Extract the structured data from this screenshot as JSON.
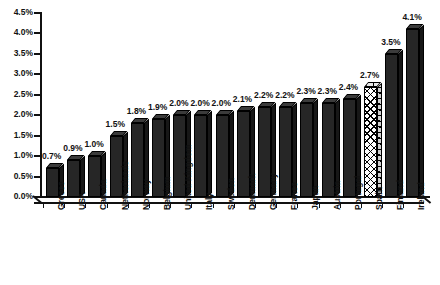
{
  "chart_data": {
    "type": "bar",
    "title": "",
    "subtitle": "",
    "xlabel": "",
    "ylabel": "",
    "ylim": [
      0.0,
      4.5
    ],
    "grid": false,
    "legend": "none",
    "orientation": "vertical",
    "style": "3d-bars",
    "value_label_format": "0.0%",
    "ytick_labels": [
      "0.0%",
      "0.5%",
      "1.0%",
      "1.5%",
      "2.0%",
      "2.5%",
      "3.0%",
      "3.5%",
      "4.0%",
      "4.5%"
    ],
    "ytick_values": [
      0.0,
      0.5,
      1.0,
      1.5,
      2.0,
      2.5,
      3.0,
      3.5,
      4.0,
      4.5
    ],
    "categories": [
      "Greece",
      "USA",
      "Canada",
      "Netherlands",
      "Norway",
      "Belgium",
      "United Kingdom",
      "Italy",
      "Sweden",
      "Denmark",
      "Germany",
      "France",
      "Japan",
      "Austria",
      "Portugal",
      "Spain",
      "Finland",
      "Ireland"
    ],
    "values": [
      0.7,
      0.9,
      1.0,
      1.5,
      1.8,
      1.9,
      2.0,
      2.0,
      2.0,
      2.1,
      2.2,
      2.2,
      2.3,
      2.3,
      2.4,
      2.7,
      3.5,
      4.1
    ],
    "value_labels": [
      "0.7%",
      "0.9%",
      "1.0%",
      "1.5%",
      "1.8%",
      "1.9%",
      "2.0%",
      "2.0%",
      "2.0%",
      "2.1%",
      "2.2%",
      "2.2%",
      "2.3%",
      "2.3%",
      "2.4%",
      "2.7%",
      "3.5%",
      "4.1%"
    ],
    "highlighted_category": "Spain",
    "highlight_style": "cross-hatch-white",
    "colors": {
      "bar_fill": "#262626",
      "bar_top": "#3b3b3b",
      "bar_side": "#171717",
      "highlight_fill": "#ffffff",
      "axis": "#111111",
      "background": "#ffffff",
      "text": "#111111"
    }
  }
}
